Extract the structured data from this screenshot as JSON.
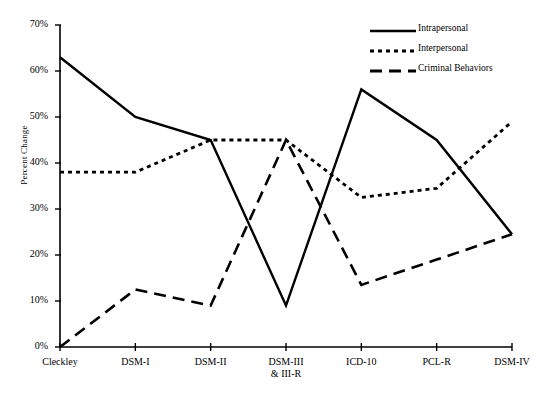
{
  "chart_data": {
    "type": "line",
    "title": "",
    "xlabel": "",
    "ylabel": "Percent Change",
    "categories": [
      "Cleckley",
      "DSM-I",
      "DSM-II",
      "DSM-III\n& III-R",
      "ICD-10",
      "PCL-R",
      "DSM-IV"
    ],
    "x_tick_labels": [
      "Cleckley",
      "DSM-I",
      "DSM-II",
      "DSM-III",
      "ICD-10",
      "PCL-R",
      "DSM-IV"
    ],
    "x_tick_labels_line2": [
      "",
      "",
      "",
      "& III-R",
      "",
      "",
      ""
    ],
    "y_tick_labels": [
      "0%",
      "10%",
      "20%",
      "30%",
      "40%",
      "50%",
      "60%",
      "70%"
    ],
    "y_ticks": [
      0,
      10,
      20,
      30,
      40,
      50,
      60,
      70
    ],
    "ylim": [
      0,
      70
    ],
    "grid": false,
    "legend_position": "top-right",
    "series": [
      {
        "name": "Intrapersonal",
        "style": "solid",
        "color": "#000000",
        "values": [
          63,
          50,
          45,
          9,
          56,
          45,
          24.5
        ]
      },
      {
        "name": "Interpersonal",
        "style": "dotted",
        "color": "#000000",
        "values": [
          38,
          38,
          45,
          45,
          32.5,
          34.5,
          49
        ]
      },
      {
        "name": "Criminal Behaviors",
        "style": "dashed",
        "color": "#000000",
        "values": [
          0,
          12.5,
          9,
          45,
          13.5,
          19,
          24.5
        ]
      }
    ]
  },
  "legend": {
    "items": [
      {
        "label": "Intrapersonal",
        "style": "solid"
      },
      {
        "label": "Interpersonal",
        "style": "dotted"
      },
      {
        "label": "Criminal Behaviors",
        "style": "dashed"
      }
    ]
  },
  "axes": {
    "y_axis_title": "Percent Change"
  }
}
